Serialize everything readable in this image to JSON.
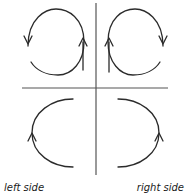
{
  "figure": {
    "type": "vector-diagram",
    "width": 187,
    "height": 196,
    "background_color": "#ffffff",
    "stroke_color": "#2b2b2b",
    "axis_color": "#555555"
  },
  "axes": {
    "vertical": {
      "name": "vertical-axis",
      "x": 96,
      "y_top": 3,
      "y_bottom": 175,
      "color": "#555555",
      "width": 1.2
    },
    "horizontal": {
      "name": "horizontal-axis",
      "y": 88,
      "x_left": 22,
      "x_right": 168,
      "color": "#555555",
      "width": 1.2
    }
  },
  "flows": [
    {
      "id": "upper-left-loop",
      "quadrant": "upper-left",
      "shape": "open-loop",
      "arrow_left": "down",
      "arrow_right": "up",
      "arrowheads": [
        {
          "name": "down-arrow-upper-left",
          "x": 28,
          "y": 42,
          "direction": "down"
        },
        {
          "name": "up-arrow-upper-left",
          "x": 83,
          "y": 38,
          "direction": "up"
        }
      ]
    },
    {
      "id": "upper-right-loop",
      "quadrant": "upper-right",
      "shape": "open-loop",
      "arrow_left": "up",
      "arrow_right": "down",
      "arrowheads": [
        {
          "name": "up-arrow-upper-right",
          "x": 109,
          "y": 38,
          "direction": "up"
        },
        {
          "name": "down-arrow-upper-right",
          "x": 163,
          "y": 42,
          "direction": "down"
        }
      ]
    },
    {
      "id": "lower-left-arc",
      "quadrant": "lower-left",
      "shape": "c-arc-open-right",
      "arrow_left": "up",
      "arrowheads": [
        {
          "name": "up-arrow-lower-left",
          "x": 32,
          "y": 133,
          "direction": "up"
        }
      ]
    },
    {
      "id": "lower-right-arc",
      "quadrant": "lower-right",
      "shape": "c-arc-open-left",
      "arrow_right": "up",
      "arrowheads": [
        {
          "name": "up-arrow-lower-right",
          "x": 159,
          "y": 133,
          "direction": "up"
        }
      ]
    }
  ],
  "captions": {
    "left": "left side",
    "right": "right side"
  }
}
